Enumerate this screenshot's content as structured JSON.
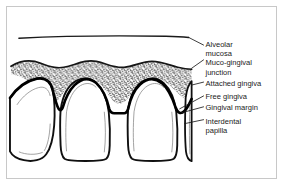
{
  "figure": {
    "background_color": "#ffffff",
    "border_color": "#c8c8c8",
    "ink_color": "#000000",
    "stipple_color": "#1a1a1a"
  },
  "labels": [
    {
      "id": "alveolar-mucosa",
      "lines": [
        "Alveolar",
        "mucosa"
      ]
    },
    {
      "id": "muco-gingival-junction",
      "lines": [
        "Muco-gingival",
        "junction"
      ]
    },
    {
      "id": "attached-gingiva",
      "lines": [
        "Attached gingiva"
      ]
    },
    {
      "id": "free-gingiva",
      "lines": [
        "Free gingiva"
      ]
    },
    {
      "id": "gingival-margin",
      "lines": [
        "Gingival margin"
      ]
    },
    {
      "id": "interdental-papilla",
      "lines": [
        "Interdental",
        "papilla"
      ]
    }
  ],
  "label_lines": {
    "l0": "Alveolar",
    "l1": "mucosa",
    "l2": "Muco-gingival",
    "l3": "junction",
    "l4": "Attached gingiva",
    "l5": "Free gingiva",
    "l6": "Gingival margin",
    "l7": "Interdental",
    "l8": "papilla"
  },
  "structures": [
    {
      "id": "alveolar-mucosa-line",
      "name": "alveolar mucosa boundary line"
    },
    {
      "id": "attached-gingiva-band",
      "name": "stippled attached gingiva band"
    },
    {
      "id": "gingival-margin-scallop",
      "name": "scalloped gingival margin"
    },
    {
      "id": "tooth-1",
      "name": "partial tooth at left edge"
    },
    {
      "id": "tooth-2",
      "name": "central tooth"
    },
    {
      "id": "tooth-3",
      "name": "central tooth"
    },
    {
      "id": "tooth-4",
      "name": "partial tooth at right edge"
    }
  ]
}
